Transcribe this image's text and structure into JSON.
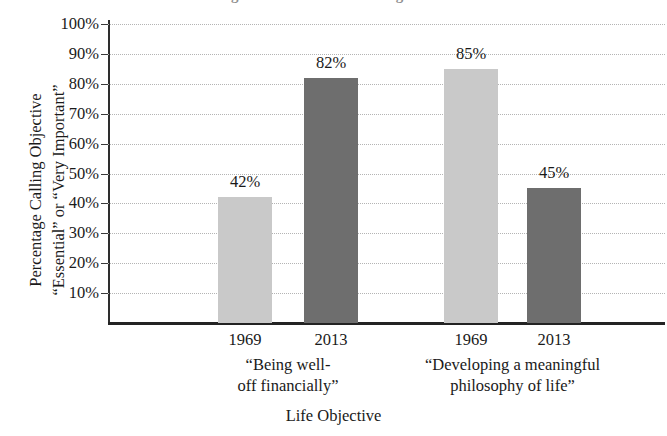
{
  "chart_data": {
    "type": "bar",
    "title": "Changes in Life Goals of College Students",
    "xlabel": "Life Objective",
    "ylabel": "Percentage Calling Objective “Essential” or “Very Important”",
    "ylabel_line1": "Percentage Calling Objective",
    "ylabel_line2": "“Essential” or “Very Important”",
    "ylim": [
      0,
      100
    ],
    "ytick_labels": [
      "100%",
      "90%",
      "80%",
      "70%",
      "60%",
      "50%",
      "40%",
      "30%",
      "20%",
      "10%"
    ],
    "ytick_values": [
      100,
      90,
      80,
      70,
      60,
      50,
      40,
      30,
      20,
      10
    ],
    "grid": true,
    "legend": "none",
    "categories": [
      "“Being well-off financially”",
      "“Developing a meaningful philosophy of life”"
    ],
    "group_label_lines": [
      [
        "“Being well-",
        "off financially”"
      ],
      [
        "“Developing a meaningful",
        "philosophy of life”"
      ]
    ],
    "series": [
      {
        "name": "1969",
        "values": [
          42,
          85
        ],
        "color": "#c9c9c9"
      },
      {
        "name": "2013",
        "values": [
          82,
          45
        ],
        "color": "#6e6e6e"
      }
    ],
    "bars": [
      {
        "group": 0,
        "series": "1969",
        "year_label": "1969",
        "value": 42,
        "value_label": "42%",
        "shade": "light"
      },
      {
        "group": 0,
        "series": "2013",
        "year_label": "2013",
        "value": 82,
        "value_label": "82%",
        "shade": "dark"
      },
      {
        "group": 1,
        "series": "1969",
        "year_label": "1969",
        "value": 85,
        "value_label": "85%",
        "shade": "light"
      },
      {
        "group": 1,
        "series": "2013",
        "year_label": "2013",
        "value": 45,
        "value_label": "45%",
        "shade": "dark"
      }
    ]
  }
}
